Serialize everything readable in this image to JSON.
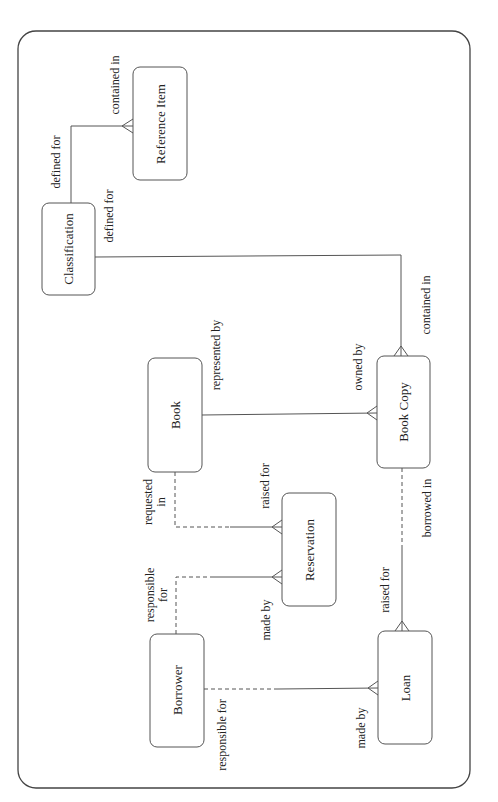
{
  "diagram": {
    "type": "entity-relationship",
    "orientation": "rotated-90-ccw",
    "entities": [
      {
        "id": "classification",
        "label": "Classification"
      },
      {
        "id": "reference_item",
        "label": "Reference Item"
      },
      {
        "id": "book",
        "label": "Book"
      },
      {
        "id": "book_copy",
        "label": "Book Copy"
      },
      {
        "id": "reservation",
        "label": "Reservation"
      },
      {
        "id": "borrower",
        "label": "Borrower"
      },
      {
        "id": "loan",
        "label": "Loan"
      }
    ],
    "relationships": [
      {
        "from": "classification",
        "to": "reference_item",
        "from_label": "defined for",
        "to_label": "contained in",
        "from_optional": false,
        "to_optional": false,
        "to_many": true
      },
      {
        "from": "classification",
        "to": "book_copy",
        "from_label": "defined for",
        "to_label": "contained in",
        "from_optional": false,
        "to_optional": false,
        "to_many": true
      },
      {
        "from": "book",
        "to": "book_copy",
        "from_label": "represented by",
        "to_label": "owned by",
        "from_optional": false,
        "to_optional": false,
        "to_many": true
      },
      {
        "from": "book",
        "to": "reservation",
        "from_label": "requested in",
        "to_label": "raised for",
        "from_optional": true,
        "to_optional": false,
        "to_many": true
      },
      {
        "from": "borrower",
        "to": "reservation",
        "from_label": "responsible for",
        "to_label": "made by",
        "from_optional": true,
        "to_optional": false,
        "to_many": true
      },
      {
        "from": "book_copy",
        "to": "loan",
        "from_label": "borrowed in",
        "to_label": "raised for",
        "from_optional": true,
        "to_optional": false,
        "to_many": true
      },
      {
        "from": "borrower",
        "to": "loan",
        "from_label": "responsible for",
        "to_label": "made by",
        "from_optional": true,
        "to_optional": false,
        "to_many": true
      }
    ],
    "labels": {
      "cls_ref_from": "defined for",
      "cls_ref_to": "contained in",
      "cls_copy_from": "defined for",
      "cls_copy_to": "contained in",
      "book_copy_from": "represented by",
      "book_copy_to": "owned by",
      "book_res_from_1": "requested",
      "book_res_from_2": "in",
      "book_res_to": "raised for",
      "bor_res_from_1": "responsible",
      "bor_res_from_2": "for",
      "bor_res_to": "made by",
      "copy_loan_from": "borrowed in",
      "copy_loan_to": "raised for",
      "bor_loan_from": "responsible for",
      "bor_loan_to": "made by"
    },
    "colors": {
      "line": "#555555",
      "text": "#222222",
      "background": "#ffffff"
    }
  }
}
